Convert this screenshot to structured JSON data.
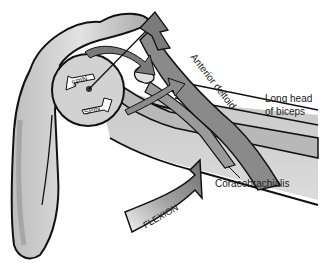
{
  "diagram": {
    "labels": {
      "anterior_deltoid": "Anterior deltoid",
      "long_head_biceps_line1": "Long head",
      "long_head_biceps_line2": "of biceps",
      "coracobrachialis": "Coracobrachialis",
      "spin_top": "SPIN",
      "spin_bottom": "SPIN",
      "flexion": "FLEXION"
    },
    "colors": {
      "bone": "#c8c8c8",
      "bone_shadow": "#9a9a9a",
      "muscle": "#8a8a8a",
      "muscle_light": "#b8b8b8",
      "outline": "#111111",
      "arrow_fill": "#7a7a7a",
      "background": "#ffffff"
    }
  }
}
